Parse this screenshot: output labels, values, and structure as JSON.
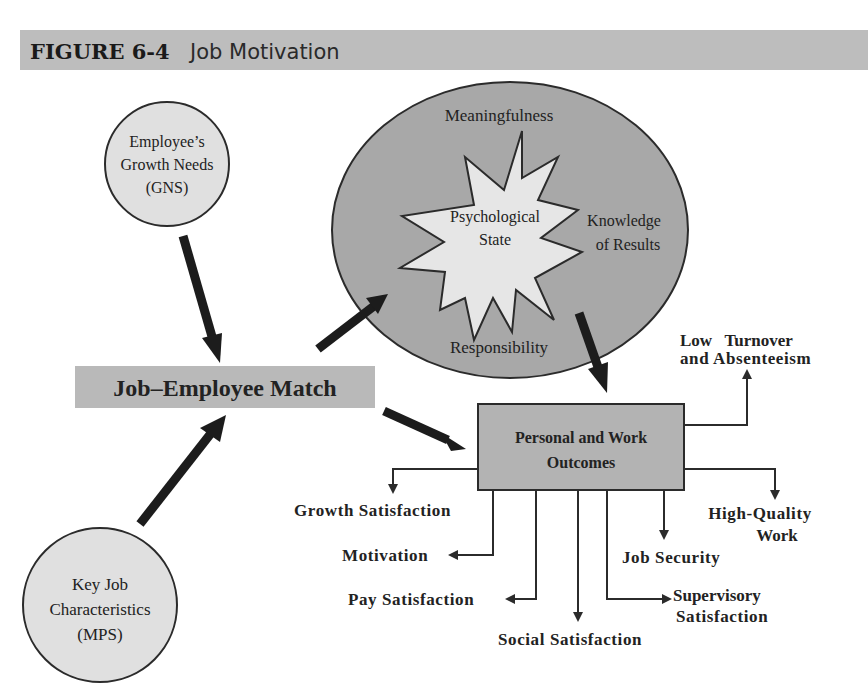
{
  "figure": {
    "label": "FIGURE 6-4",
    "title": "Job Motivation"
  },
  "inputs": {
    "growth_needs": {
      "line1": "Employee’s",
      "line2": "Growth Needs",
      "line3": "(GNS)"
    },
    "job_characteristics": {
      "line1": "Key Job",
      "line2": "Characteristics",
      "line3": "(MPS)"
    }
  },
  "match": {
    "label": "Job–Employee Match"
  },
  "psychological_state": {
    "center_line1": "Psychological",
    "center_line2": "State",
    "meaningfulness": "Meaningfulness",
    "knowledge_line1": "Knowledge",
    "knowledge_line2": "of Results",
    "responsibility": "Responsibility"
  },
  "outcomes_box": {
    "line1": "Personal and Work",
    "line2": "Outcomes"
  },
  "outcomes": {
    "low_turnover": {
      "line1": "Low   Turnover",
      "line2": "and Absenteeism"
    },
    "high_quality": {
      "line1": "High-Quality",
      "line2": "Work"
    },
    "growth_satisfaction": "Growth Satisfaction",
    "motivation": "Motivation",
    "pay_satisfaction": "Pay Satisfaction",
    "social_satisfaction": "Social Satisfaction",
    "job_security": "Job Security",
    "supervisory": {
      "line1": "Supervisory",
      "line2": "Satisfaction"
    }
  },
  "colors": {
    "title_bar": "#bdbdbd",
    "light_circle": "#e0e0e0",
    "state_ellipse": "#a8a8a8",
    "match_box": "#b9b9b9",
    "outcome_box": "#b3b3b3",
    "arrow": "#1c1c1c"
  }
}
